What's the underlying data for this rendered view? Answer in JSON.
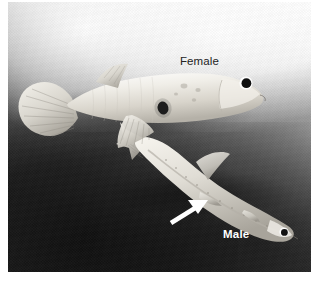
{
  "figure": {
    "kind": "photograph",
    "rendering": "grayscale",
    "width": 319,
    "height": 285
  },
  "photo": {
    "background": {
      "description": "diagonal gradient, bright upper-right to dark lower-left",
      "light_hex": "#fdfdfd",
      "mid_hex": "#8a8a8a",
      "dark_hex": "#242424"
    },
    "plate": {
      "left": 8,
      "top": 2,
      "width": 303,
      "height": 270
    }
  },
  "labels": [
    {
      "id": "female",
      "text": "Female",
      "color": "#232323",
      "weight": "normal",
      "x": 172,
      "y": 54
    },
    {
      "id": "male",
      "text": "Male",
      "color": "#ffffff",
      "weight": "bold",
      "x": 215,
      "y": 227
    }
  ],
  "annotations": [
    {
      "id": "gonopodium-arrow",
      "type": "arrow",
      "color": "#ffffff",
      "points_to": "gonopodium",
      "direction": "up-right",
      "tail_x": 171,
      "tail_y": 222,
      "tip_x": 206,
      "tip_y": 200
    }
  ],
  "subjects": [
    {
      "id": "female-guppy",
      "label": "Female",
      "orientation": "head-right",
      "body_hex": "#e8e6e0",
      "features": [
        {
          "name": "caudal-fin",
          "hex": "#dcd9d2"
        },
        {
          "name": "dorsal-fin",
          "hex": "#dedcd5"
        },
        {
          "name": "pectoral-fin",
          "hex": "#d6d3cc"
        },
        {
          "name": "gravid-spot",
          "hex": "#1e1e1e"
        },
        {
          "name": "eye",
          "hex": "#111111"
        }
      ]
    },
    {
      "id": "male-guppy",
      "label": "Male",
      "orientation": "head-right-down",
      "body_hex": "#ddd9d1",
      "features": [
        {
          "name": "caudal-fin",
          "hex": "#cfccc4"
        },
        {
          "name": "dorsal-fin",
          "hex": "#d2cfc7"
        },
        {
          "name": "gonopodium",
          "hex": "#d8d4cc"
        },
        {
          "name": "eye",
          "hex": "#111111"
        }
      ]
    }
  ]
}
